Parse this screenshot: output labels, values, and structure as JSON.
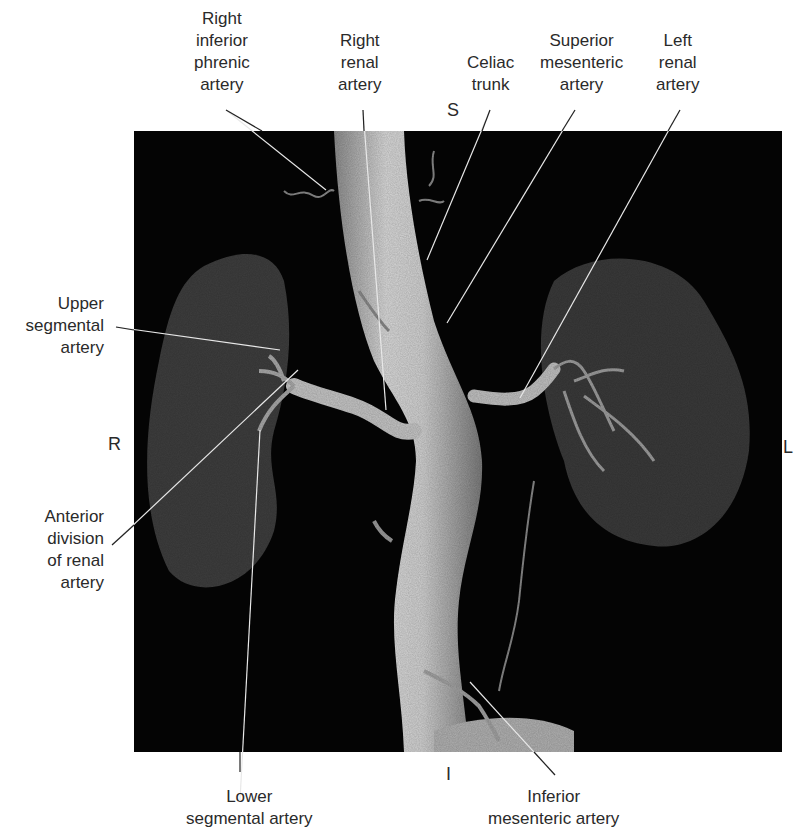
{
  "figure": {
    "orientation": {
      "superior": "S",
      "inferior": "I",
      "right": "R",
      "left": "L"
    },
    "labels": [
      {
        "id": "right-inferior-phrenic-artery",
        "lines": [
          "Right",
          "inferior",
          "phrenic",
          "artery"
        ]
      },
      {
        "id": "right-renal-artery",
        "lines": [
          "Right",
          "renal",
          "artery"
        ]
      },
      {
        "id": "celiac-trunk",
        "lines": [
          "Celiac",
          "trunk"
        ]
      },
      {
        "id": "superior-mesenteric-artery",
        "lines": [
          "Superior",
          "mesenteric",
          "artery"
        ]
      },
      {
        "id": "left-renal-artery",
        "lines": [
          "Left",
          "renal",
          "artery"
        ]
      },
      {
        "id": "upper-segmental-artery",
        "lines": [
          "Upper",
          "segmental",
          "artery"
        ]
      },
      {
        "id": "anterior-division-of-renal-artery",
        "lines": [
          "Anterior",
          "division",
          "of renal",
          "artery"
        ]
      },
      {
        "id": "lower-segmental-artery",
        "lines": [
          "Lower",
          "segmental artery"
        ]
      },
      {
        "id": "inferior-mesenteric-artery",
        "lines": [
          "Inferior",
          "mesenteric artery"
        ]
      }
    ]
  }
}
